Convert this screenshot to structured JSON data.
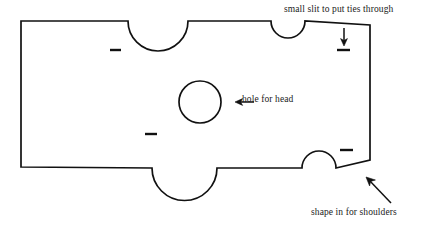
{
  "diagram": {
    "type": "sewing-pattern",
    "stroke_color": "#111111",
    "fill_color": "#ffffff",
    "background_color": "#ffffff",
    "annotations": [
      {
        "id": "slit",
        "text": "small slit to put ties through",
        "arrow": "down",
        "points_to": "top-right-slit"
      },
      {
        "id": "head",
        "text": "hole for head",
        "arrow": "left",
        "points_to": "head-hole-circle"
      },
      {
        "id": "shoulders",
        "text": "shape in for shoulders",
        "arrow": "up-left",
        "points_to": "right-shoulder-taper"
      }
    ],
    "features": {
      "head_hole": {
        "cx": 200,
        "cy": 102,
        "r": 21
      },
      "slits": [
        {
          "id": "slit-top-left",
          "x1": 110,
          "x2": 121,
          "y": 50
        },
        {
          "id": "slit-mid-left",
          "x1": 145,
          "x2": 157,
          "y": 134
        },
        {
          "id": "slit-top-right",
          "x1": 337,
          "x2": 350,
          "y": 50
        },
        {
          "id": "slit-bottom-right",
          "x1": 340,
          "x2": 353,
          "y": 150
        }
      ],
      "notches": [
        {
          "id": "notch-top-large",
          "edge": "top",
          "cx": 158,
          "r": 30
        },
        {
          "id": "notch-top-small",
          "edge": "top",
          "cx": 288,
          "r": 17
        },
        {
          "id": "notch-bottom-large",
          "edge": "bottom",
          "cx": 184,
          "r": 32
        },
        {
          "id": "notch-bottom-small",
          "edge": "bottom",
          "cx": 318,
          "r": 17
        }
      ]
    }
  }
}
